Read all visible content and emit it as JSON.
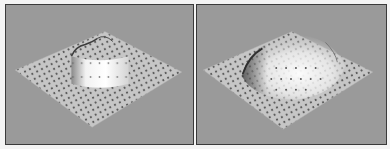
{
  "figure": {
    "panels": [
      {
        "id": "left",
        "description": "Grid surface with flat-topped cylindrical bump",
        "bump_shape": "flat-top-cylinder",
        "background_color": "#9a9a9a",
        "surface_color": "#c8c8c8",
        "dot_color": "#555555"
      },
      {
        "id": "right",
        "description": "Grid surface with smooth dome-shaped bump",
        "bump_shape": "smooth-dome",
        "background_color": "#9a9a9a",
        "surface_color": "#c8c8c8",
        "dot_color": "#555555"
      }
    ]
  }
}
